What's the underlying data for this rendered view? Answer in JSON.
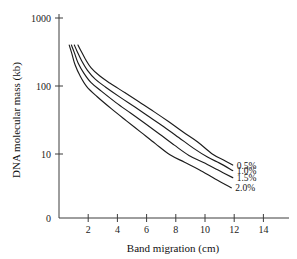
{
  "chart_data": {
    "type": "line",
    "title": "",
    "xlabel": "Band migration (cm)",
    "ylabel": "DNA molecular mass (kb)",
    "xlim": [
      0,
      15.7
    ],
    "ylim": [
      0,
      1000
    ],
    "yscale": "log-like",
    "grid": false,
    "legend_position": "inline-right-end",
    "xticks": [
      2,
      4,
      6,
      8,
      10,
      12,
      14
    ],
    "xtick_labels": [
      "2",
      "4",
      "6",
      "8",
      "10",
      "12",
      "14"
    ],
    "yticks": [
      0,
      10,
      100,
      1000
    ],
    "ytick_labels": [
      "0",
      "10",
      "100",
      "1000"
    ],
    "series": [
      {
        "name": "0.5%",
        "label": "0.5%",
        "color": "#1c1c1c",
        "x": [
          1.3,
          1.5,
          1.8,
          2.2,
          2.8,
          3.5,
          4.5,
          5.5,
          6.5,
          7.5,
          8.5,
          9.5,
          10.5,
          11.3,
          11.9
        ],
        "y": [
          400,
          330,
          250,
          185,
          140,
          110,
          80,
          58,
          42,
          30,
          21,
          15,
          10,
          7.2,
          5.6
        ]
      },
      {
        "name": "1.0%",
        "label": "1.0%",
        "color": "#1c1c1c",
        "x": [
          1.05,
          1.25,
          1.55,
          1.95,
          2.5,
          3.2,
          4.2,
          5.2,
          6.2,
          7.2,
          8.2,
          9.2,
          10.2,
          11.0,
          11.9
        ],
        "y": [
          400,
          320,
          235,
          170,
          125,
          96,
          68,
          49,
          35,
          25,
          17.5,
          12.2,
          8.4,
          6.2,
          4.2
        ]
      },
      {
        "name": "1.5%",
        "label": "1.5%",
        "color": "#1c1c1c",
        "x": [
          0.85,
          1.05,
          1.3,
          1.7,
          2.2,
          2.9,
          3.9,
          4.9,
          5.9,
          6.9,
          7.9,
          8.9,
          9.9,
          10.9,
          11.9
        ],
        "y": [
          400,
          310,
          220,
          155,
          112,
          84,
          57,
          40,
          28,
          19.5,
          13.5,
          9.3,
          6.4,
          4.3,
          2.9
        ]
      },
      {
        "name": "2.0%",
        "label": "2.0%",
        "color": "#1c1c1c",
        "x": [
          0.7,
          0.88,
          1.1,
          1.45,
          1.9,
          2.6,
          3.6,
          4.6,
          5.6,
          6.6,
          7.6,
          8.6,
          9.6,
          10.7,
          11.8
        ],
        "y": [
          400,
          300,
          205,
          140,
          98,
          70,
          46,
          31,
          21,
          14.2,
          9.6,
          6.5,
          4.4,
          2.7,
          1.7
        ]
      }
    ]
  },
  "labels": {
    "x_axis_title": "Band migration (cm)",
    "y_axis_title": "DNA molecular mass (kb)"
  }
}
